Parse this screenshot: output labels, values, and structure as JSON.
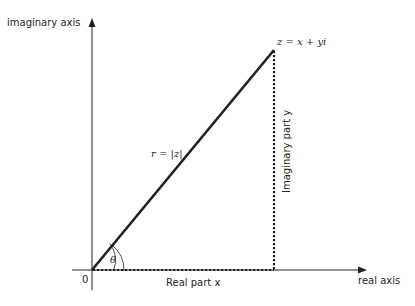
{
  "diagram": {
    "type": "complex-plane-polar-form",
    "colors": {
      "ink": "#231f20",
      "background": "#ffffff"
    },
    "axes": {
      "vertical_label": "imaginary axis",
      "horizontal_label": "real axis",
      "origin_label": "0"
    },
    "point": {
      "label": "z = x + yi"
    },
    "radius": {
      "label": "r = |z|"
    },
    "angle": {
      "label": "θ"
    },
    "projections": {
      "real_label": "Real part x",
      "imaginary_label": "Imaginary part y"
    }
  }
}
